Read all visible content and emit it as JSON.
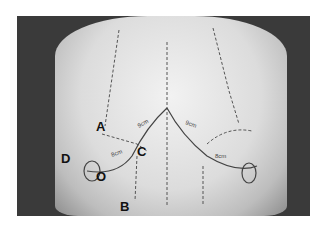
{
  "figure": {
    "labels": [
      {
        "id": "A",
        "text": "A",
        "x": 96,
        "y": 120
      },
      {
        "id": "B",
        "text": "B",
        "x": 120,
        "y": 200
      },
      {
        "id": "C",
        "text": "C",
        "x": 137,
        "y": 145
      },
      {
        "id": "D",
        "text": "D",
        "x": 61,
        "y": 152
      },
      {
        "id": "O",
        "text": "O",
        "x": 96,
        "y": 170
      }
    ],
    "measurements": [
      {
        "text": "9cm",
        "location": "right-upper"
      },
      {
        "text": "8cm",
        "location": "right-lower"
      },
      {
        "text": "9cm",
        "location": "left-upper"
      },
      {
        "text": "8cm",
        "location": "left-lower"
      }
    ],
    "colors": {
      "background": "#ffffff",
      "photo_bg": "#3a3a3a",
      "marking": "#555555",
      "label": "#111111"
    }
  }
}
